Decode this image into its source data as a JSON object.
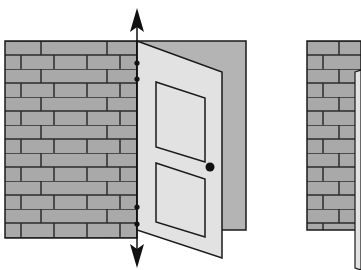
{
  "figure": {
    "colors": {
      "background": "#ffffff",
      "brick": "#a9a9a9",
      "mortar": "#2a2a2a",
      "backdrop": "#b4b4b4",
      "door": "#e2e2e2",
      "outline": "#1a1a1a",
      "knob": "#111111"
    },
    "left_scene": {
      "wall": {
        "x": 5,
        "y": 41,
        "width": 132,
        "height": 197,
        "brick_rows": 14
      },
      "hinge_axis": {
        "x": 137,
        "top_arrow_y": 8,
        "bottom_arrow_y": 268
      },
      "hinge_dots": [
        {
          "y": 63
        },
        {
          "y": 79
        },
        {
          "y": 207
        },
        {
          "y": 224
        }
      ],
      "door": {
        "panels": 2,
        "knob": {
          "x": 210,
          "y": 167
        }
      }
    },
    "right_scene": {
      "wall": {
        "x": 307,
        "y": 41,
        "width": 50,
        "height": 189
      }
    }
  }
}
